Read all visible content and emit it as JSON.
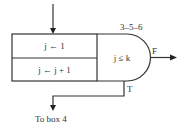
{
  "diagram": {
    "type": "flowchart",
    "loop_box": {
      "init_statement": "j ← 1",
      "increment_statement": "j ← j + 1",
      "condition": "j ≤ k",
      "reference_label": "3–5–6"
    },
    "branches": {
      "false_label": "F",
      "true_label": "T"
    },
    "exit_target": "To box 4",
    "colors": {
      "stroke": "#333333",
      "background": "#ffffff"
    }
  }
}
